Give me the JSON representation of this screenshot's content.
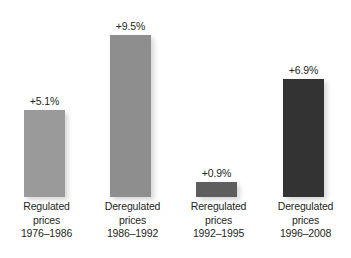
{
  "chart_data": {
    "type": "bar",
    "title": "",
    "subtitle": "",
    "xlabel": "",
    "ylabel": "",
    "grid": false,
    "legend": false,
    "legend_position": "none",
    "axis_visible": false,
    "ylim": [
      0,
      10
    ],
    "categories": [
      "Regulated prices 1976–1986",
      "Deregulated prices 1986–1992",
      "Reregulated prices 1992–1995",
      "Deregulated prices 1996–2008"
    ],
    "values": [
      5.1,
      9.5,
      0.9,
      6.9
    ],
    "value_labels": [
      "+5.1%",
      "+9.5%",
      "+0.9%",
      "+6.9%"
    ],
    "bar_colors": [
      "#9a9a9a",
      "#8e8e8e",
      "#5e5e5e",
      "#333333"
    ],
    "bars": [
      {
        "id": "bar-regulated-1976-1986",
        "value": 5.1,
        "value_label": "+5.1%",
        "color": "#9a9a9a",
        "label_line1": "Regulated",
        "label_line2": "prices",
        "label_line3": "1976–1986"
      },
      {
        "id": "bar-deregulated-1986-1992",
        "value": 9.5,
        "value_label": "+9.5%",
        "color": "#8e8e8e",
        "label_line1": "Deregulated",
        "label_line2": "prices",
        "label_line3": "1986–1992"
      },
      {
        "id": "bar-reregulated-1992-1995",
        "value": 0.9,
        "value_label": "+0.9%",
        "color": "#5e5e5e",
        "label_line1": "Reregulated",
        "label_line2": "prices",
        "label_line3": "1992–1995"
      },
      {
        "id": "bar-deregulated-1996-2008",
        "value": 6.9,
        "value_label": "+6.9%",
        "color": "#333333",
        "label_line1": "Deregulated",
        "label_line2": "prices",
        "label_line3": "1996–2008"
      }
    ]
  },
  "geometry": {
    "baseline_y": 197,
    "px_per_percent": 17.05,
    "bar_width": 41,
    "bar_left_positions": [
      24,
      110,
      196,
      283
    ],
    "label_left_positions": [
      -11,
      75,
      161,
      248
    ],
    "label_box_width": 115
  },
  "colors": {
    "background": "#ffffff",
    "text": "#231f20"
  }
}
